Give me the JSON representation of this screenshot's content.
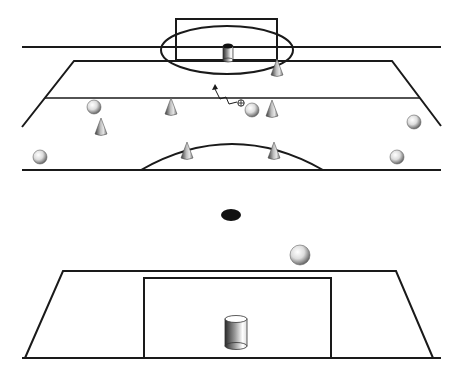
{
  "diagram": {
    "type": "soccer-drill",
    "colors": {
      "line": "#1a1a1a",
      "background": "#ffffff",
      "marker": "#111111"
    },
    "top_field": {
      "goal_box": {
        "x": 176,
        "y": 19,
        "w": 101,
        "h": 41
      },
      "circle": {
        "cx": 227,
        "cy": 50,
        "rx": 66,
        "ry": 24
      },
      "goal_marker": {
        "kind": "bin",
        "x": 228,
        "y": 55
      },
      "cones": [
        {
          "x": 277,
          "y": 70
        },
        {
          "x": 171,
          "y": 109
        },
        {
          "x": 272,
          "y": 111
        },
        {
          "x": 101,
          "y": 129
        },
        {
          "x": 187,
          "y": 153
        },
        {
          "x": 274,
          "y": 153
        }
      ],
      "balls": [
        {
          "x": 94,
          "y": 107
        },
        {
          "x": 252,
          "y": 110
        },
        {
          "x": 414,
          "y": 122
        },
        {
          "x": 40,
          "y": 157
        },
        {
          "x": 397,
          "y": 157
        }
      ],
      "player_marker": {
        "x": 241,
        "y": 103
      },
      "dribble_path": "zigzag-arrow"
    },
    "center_marker": {
      "x": 231,
      "y": 215
    },
    "loose_ball": {
      "x": 300,
      "y": 255
    },
    "bottom_field": {
      "goal_box": {
        "x": 144,
        "y": 278,
        "w": 187,
        "h": 80
      },
      "goal_marker": {
        "kind": "bin",
        "x": 236,
        "y": 333
      }
    }
  }
}
